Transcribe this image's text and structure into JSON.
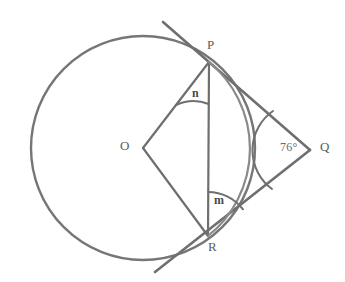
{
  "figure": {
    "kind": "circle-tangent-geometry-diagram",
    "background_color": "#ffffff",
    "stroke_color": "#6f6f6f",
    "stroke_color_light": "#8a8a8a",
    "label_color": "#5c5c5c"
  },
  "labels": {
    "center": "O",
    "point_p": "P",
    "point_q": "Q",
    "point_r": "R",
    "angle_n": "n",
    "angle_m": "m",
    "angle_q": "76°"
  },
  "geometry": {
    "circle": {
      "cx": 143,
      "cy": 148,
      "r": 112
    },
    "points": {
      "O": {
        "x": 143,
        "y": 148
      },
      "P": {
        "x": 209,
        "y": 62
      },
      "Q": {
        "x": 310,
        "y": 150
      },
      "R": {
        "x": 208,
        "y": 236
      }
    },
    "segments": [
      {
        "name": "radius-OP",
        "from": "O",
        "to": "P"
      },
      {
        "name": "radius-OR",
        "from": "O",
        "to": "R"
      },
      {
        "name": "chord-PR",
        "from": "P",
        "to": "R"
      },
      {
        "name": "tangent-PQ",
        "from": "P",
        "to": "Q"
      },
      {
        "name": "tangent-RQ",
        "from": "R",
        "to": "Q"
      }
    ],
    "tangent_line_p": {
      "x1": 163,
      "y1": 22,
      "x2": 310,
      "y2": 150
    },
    "tangent_line_r": {
      "x1": 155,
      "y1": 272,
      "x2": 310,
      "y2": 150
    },
    "angle_arcs": [
      {
        "name": "angle-n-at-P",
        "vertex": "P",
        "radius": 42
      },
      {
        "name": "angle-m-at-R",
        "vertex": "R",
        "radius": 44
      },
      {
        "name": "angle-q-at-Q",
        "vertex": "Q",
        "radius": 48
      }
    ]
  }
}
